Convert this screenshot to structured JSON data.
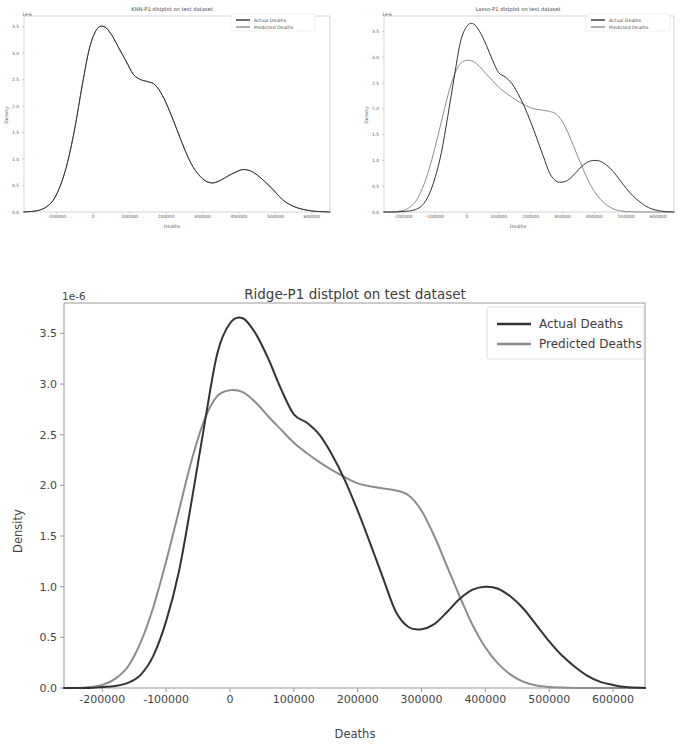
{
  "figures": {
    "knn": {
      "title": "KNN-P1 distplot on test dataset",
      "xlabel": "Deaths",
      "ylabel": "Density",
      "offset": "1e-6",
      "legend": {
        "actual": "Actual Deaths",
        "predicted": "Predicted Deaths"
      }
    },
    "lasso": {
      "title": "Lasso-P1 distplot on test dataset",
      "xlabel": "Deaths",
      "ylabel": "Density",
      "offset": "1e-6",
      "legend": {
        "actual": "Actual Deaths",
        "predicted": "Predicted Deaths"
      }
    },
    "ridge": {
      "title": "Ridge-P1 distplot on test dataset",
      "xlabel": "Deaths",
      "ylabel": "Density",
      "offset": "1e-6",
      "legend": {
        "actual": "Actual Deaths",
        "predicted": "Predicted Deaths"
      }
    }
  },
  "colors": {
    "actual": "#333333",
    "predicted": "#8c8c8c",
    "spine": "#9a9a9a",
    "text": "#444444",
    "background": "#ffffff"
  },
  "chart_data": [
    {
      "id": "ridge",
      "type": "line",
      "title": "Ridge-P1 distplot on test dataset",
      "xlabel": "Deaths",
      "ylabel": "Density",
      "y_offset_exponent": "1e-6",
      "grid": false,
      "legend_position": "upper right",
      "xlim": [
        -260000,
        650000
      ],
      "ylim": [
        0.0,
        3.8
      ],
      "xticks": [
        -200000,
        -100000,
        0,
        100000,
        200000,
        300000,
        400000,
        500000,
        600000
      ],
      "xticklabels": [
        "-200000",
        "-100000",
        "0",
        "100000",
        "200000",
        "300000",
        "400000",
        "500000",
        "600000"
      ],
      "yticks": [
        0.0,
        0.5,
        1.0,
        1.5,
        2.0,
        2.5,
        3.0,
        3.5
      ],
      "yticklabels": [
        "0.0",
        "0.5",
        "1.0",
        "1.5",
        "2.0",
        "2.5",
        "3.0",
        "3.5"
      ],
      "x": [
        -260000,
        -240000,
        -220000,
        -200000,
        -180000,
        -160000,
        -140000,
        -120000,
        -100000,
        -80000,
        -60000,
        -40000,
        -20000,
        0,
        20000,
        40000,
        60000,
        80000,
        100000,
        120000,
        140000,
        160000,
        180000,
        200000,
        220000,
        240000,
        260000,
        280000,
        300000,
        320000,
        340000,
        360000,
        380000,
        400000,
        420000,
        440000,
        460000,
        480000,
        500000,
        520000,
        540000,
        560000,
        580000,
        600000,
        620000,
        650000
      ],
      "series": [
        {
          "name": "Actual Deaths",
          "color": "#333333",
          "linewidth": 2.0,
          "values": [
            0.0,
            0.0,
            0.0,
            0.01,
            0.02,
            0.05,
            0.13,
            0.32,
            0.66,
            1.15,
            1.85,
            2.6,
            3.3,
            3.6,
            3.65,
            3.5,
            3.25,
            2.95,
            2.7,
            2.62,
            2.5,
            2.3,
            2.05,
            1.75,
            1.42,
            1.08,
            0.75,
            0.6,
            0.58,
            0.63,
            0.75,
            0.88,
            0.97,
            1.0,
            0.98,
            0.9,
            0.78,
            0.62,
            0.46,
            0.32,
            0.21,
            0.12,
            0.06,
            0.03,
            0.01,
            0.0
          ]
        },
        {
          "name": "Predicted Deaths",
          "color": "#8c8c8c",
          "linewidth": 2.0,
          "values": [
            0.0,
            0.0,
            0.01,
            0.03,
            0.09,
            0.21,
            0.45,
            0.8,
            1.25,
            1.75,
            2.25,
            2.65,
            2.88,
            2.94,
            2.92,
            2.82,
            2.68,
            2.55,
            2.42,
            2.32,
            2.23,
            2.15,
            2.08,
            2.02,
            1.99,
            1.97,
            1.95,
            1.9,
            1.75,
            1.5,
            1.2,
            0.9,
            0.62,
            0.4,
            0.24,
            0.13,
            0.06,
            0.025,
            0.01,
            0.004,
            0.0,
            0.0,
            0.0,
            0.0,
            0.0,
            0.0
          ]
        }
      ]
    },
    {
      "id": "knn",
      "type": "line",
      "title": "KNN-P1 distplot on test dataset",
      "xlabel": "Deaths",
      "ylabel": "Density",
      "y_offset_exponent": "1e-6",
      "grid": false,
      "legend_position": "upper right",
      "xlim": [
        -190000,
        650000
      ],
      "ylim": [
        0.0,
        3.7
      ],
      "xticks": [
        -100000,
        0,
        100000,
        200000,
        300000,
        400000,
        500000,
        600000
      ],
      "xticklabels": [
        "-100000",
        "0",
        "100000",
        "200000",
        "300000",
        "400000",
        "500000",
        "600000"
      ],
      "yticks": [
        0.0,
        0.5,
        1.0,
        1.5,
        2.0,
        2.5,
        3.0,
        3.5
      ],
      "yticklabels": [
        "0.0",
        "0.5",
        "1.0",
        "1.5",
        "2.0",
        "2.5",
        "3.0",
        "3.5"
      ],
      "x": [
        -190000,
        -170000,
        -150000,
        -130000,
        -110000,
        -90000,
        -70000,
        -50000,
        -30000,
        -10000,
        10000,
        30000,
        50000,
        70000,
        90000,
        110000,
        130000,
        150000,
        170000,
        190000,
        210000,
        230000,
        250000,
        270000,
        290000,
        310000,
        330000,
        350000,
        370000,
        390000,
        410000,
        430000,
        450000,
        470000,
        490000,
        510000,
        530000,
        560000,
        600000,
        650000
      ],
      "series": [
        {
          "name": "Actual Deaths",
          "color": "#333333",
          "linewidth": 1.0,
          "values": [
            0.0,
            0.01,
            0.03,
            0.09,
            0.22,
            0.5,
            0.95,
            1.6,
            2.4,
            3.1,
            3.45,
            3.5,
            3.35,
            3.1,
            2.85,
            2.6,
            2.5,
            2.46,
            2.4,
            2.2,
            1.9,
            1.55,
            1.2,
            0.9,
            0.7,
            0.58,
            0.55,
            0.6,
            0.68,
            0.75,
            0.8,
            0.78,
            0.7,
            0.58,
            0.45,
            0.3,
            0.18,
            0.08,
            0.02,
            0.0
          ]
        },
        {
          "name": "Predicted Deaths",
          "color": "#8c8c8c",
          "linewidth": 1.0,
          "values": [
            0.0,
            0.01,
            0.03,
            0.09,
            0.22,
            0.5,
            0.95,
            1.6,
            2.4,
            3.1,
            3.45,
            3.5,
            3.35,
            3.1,
            2.85,
            2.6,
            2.5,
            2.46,
            2.4,
            2.2,
            1.9,
            1.55,
            1.2,
            0.9,
            0.7,
            0.58,
            0.55,
            0.6,
            0.68,
            0.75,
            0.8,
            0.78,
            0.7,
            0.58,
            0.45,
            0.3,
            0.18,
            0.08,
            0.02,
            0.0
          ]
        }
      ]
    },
    {
      "id": "lasso",
      "type": "line",
      "title": "Lasso-P1 distplot on test dataset",
      "xlabel": "Deaths",
      "ylabel": "Density",
      "y_offset_exponent": "1e-6",
      "grid": false,
      "legend_position": "upper right",
      "xlim": [
        -260000,
        650000
      ],
      "ylim": [
        0.0,
        3.8
      ],
      "xticks": [
        -200000,
        -100000,
        0,
        100000,
        200000,
        300000,
        400000,
        500000,
        600000
      ],
      "xticklabels": [
        "-200000",
        "-100000",
        "0",
        "100000",
        "200000",
        "300000",
        "400000",
        "500000",
        "600000"
      ],
      "yticks": [
        0.0,
        0.5,
        1.0,
        1.5,
        2.0,
        2.5,
        3.0,
        3.5
      ],
      "yticklabels": [
        "0.0",
        "0.5",
        "1.0",
        "1.5",
        "2.0",
        "2.5",
        "3.0",
        "3.5"
      ],
      "x": [
        -260000,
        -240000,
        -220000,
        -200000,
        -180000,
        -160000,
        -140000,
        -120000,
        -100000,
        -80000,
        -60000,
        -40000,
        -20000,
        0,
        20000,
        40000,
        60000,
        80000,
        100000,
        120000,
        140000,
        160000,
        180000,
        200000,
        220000,
        240000,
        260000,
        280000,
        300000,
        320000,
        340000,
        360000,
        380000,
        400000,
        420000,
        440000,
        460000,
        480000,
        500000,
        520000,
        540000,
        560000,
        580000,
        600000,
        620000,
        650000
      ],
      "series": [
        {
          "name": "Actual Deaths",
          "color": "#333333",
          "linewidth": 1.0,
          "values": [
            0.0,
            0.0,
            0.0,
            0.01,
            0.02,
            0.05,
            0.13,
            0.32,
            0.66,
            1.15,
            1.85,
            2.6,
            3.3,
            3.6,
            3.65,
            3.5,
            3.25,
            2.95,
            2.7,
            2.62,
            2.5,
            2.3,
            2.05,
            1.75,
            1.42,
            1.08,
            0.75,
            0.6,
            0.58,
            0.63,
            0.75,
            0.88,
            0.97,
            1.0,
            0.98,
            0.9,
            0.78,
            0.62,
            0.46,
            0.32,
            0.21,
            0.12,
            0.06,
            0.03,
            0.01,
            0.0
          ]
        },
        {
          "name": "Predicted Deaths",
          "color": "#8c8c8c",
          "linewidth": 1.0,
          "values": [
            0.0,
            0.0,
            0.01,
            0.03,
            0.09,
            0.21,
            0.45,
            0.8,
            1.25,
            1.75,
            2.25,
            2.65,
            2.88,
            2.94,
            2.92,
            2.82,
            2.68,
            2.55,
            2.42,
            2.32,
            2.23,
            2.15,
            2.08,
            2.02,
            1.99,
            1.97,
            1.95,
            1.9,
            1.75,
            1.5,
            1.2,
            0.9,
            0.62,
            0.4,
            0.24,
            0.13,
            0.06,
            0.025,
            0.01,
            0.004,
            0.0,
            0.0,
            0.0,
            0.0,
            0.0,
            0.0
          ]
        }
      ]
    }
  ]
}
